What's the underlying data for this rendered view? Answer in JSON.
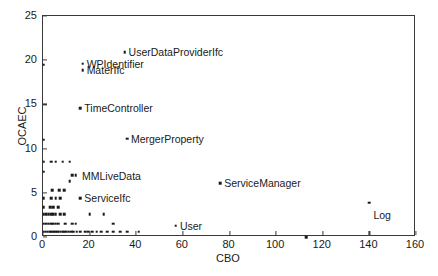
{
  "chart_data": {
    "type": "scatter",
    "title": "",
    "xlabel": "CBO",
    "ylabel": "OCAEC",
    "xlim": [
      0,
      160
    ],
    "ylim": [
      0,
      25
    ],
    "xticks": [
      0,
      20,
      40,
      60,
      80,
      100,
      120,
      140,
      160
    ],
    "yticks": [
      0,
      5,
      10,
      15,
      20,
      25
    ],
    "grid": false,
    "legend": null,
    "marker": "square-dot",
    "marker_color": "#1a1a1a",
    "annotations": [
      {
        "label": "UserDataProviderIfc",
        "x": 35,
        "y": 20.9,
        "anchor": "right"
      },
      {
        "label": "WPIdentifier",
        "x": 17,
        "y": 19.6,
        "anchor": "right"
      },
      {
        "label": "MaterIfc",
        "x": 17,
        "y": 18.9,
        "anchor": "right"
      },
      {
        "label": "TimeController",
        "x": 16,
        "y": 14.6,
        "anchor": "right"
      },
      {
        "label": "MergerProperty",
        "x": 36,
        "y": 11.1,
        "anchor": "right"
      },
      {
        "label": "MMLiveData",
        "x": 15,
        "y": 6.9,
        "anchor": "right"
      },
      {
        "label": "ServiceIfc",
        "x": 16,
        "y": 4.4,
        "anchor": "right"
      },
      {
        "label": "ServiceManager",
        "x": 76,
        "y": 6.1,
        "anchor": "right"
      },
      {
        "label": "User",
        "x": 57,
        "y": 1.3,
        "anchor": "right"
      },
      {
        "label": "Log",
        "x": 140,
        "y": 3.9,
        "anchor": "below-right"
      }
    ],
    "points": [
      {
        "x": 35,
        "y": 20.9
      },
      {
        "x": 17,
        "y": 19.6
      },
      {
        "x": 17,
        "y": 18.9
      },
      {
        "x": 0.3,
        "y": 19.5
      },
      {
        "x": 16,
        "y": 14.6
      },
      {
        "x": 36,
        "y": 11.1
      },
      {
        "x": 0.3,
        "y": 11.0
      },
      {
        "x": 0.3,
        "y": 8.5
      },
      {
        "x": 3.5,
        "y": 8.5
      },
      {
        "x": 5.5,
        "y": 8.5
      },
      {
        "x": 8.5,
        "y": 8.5
      },
      {
        "x": 11.5,
        "y": 8.5
      },
      {
        "x": 0.3,
        "y": 7.4
      },
      {
        "x": 12.5,
        "y": 7.0
      },
      {
        "x": 14.0,
        "y": 7.0
      },
      {
        "x": 11.5,
        "y": 6.3
      },
      {
        "x": 76,
        "y": 6.1
      },
      {
        "x": 4.0,
        "y": 5.3
      },
      {
        "x": 7.0,
        "y": 5.3
      },
      {
        "x": 9.0,
        "y": 5.3
      },
      {
        "x": 0.3,
        "y": 4.4
      },
      {
        "x": 3.5,
        "y": 4.4
      },
      {
        "x": 5.5,
        "y": 4.4
      },
      {
        "x": 7.5,
        "y": 4.4
      },
      {
        "x": 16,
        "y": 4.4
      },
      {
        "x": 140,
        "y": 3.9
      },
      {
        "x": 0.3,
        "y": 3.4
      },
      {
        "x": 3.0,
        "y": 3.4
      },
      {
        "x": 4.5,
        "y": 3.4
      },
      {
        "x": 6.5,
        "y": 3.4
      },
      {
        "x": 0.3,
        "y": 2.6
      },
      {
        "x": 1.5,
        "y": 2.6
      },
      {
        "x": 2.5,
        "y": 2.6
      },
      {
        "x": 3.5,
        "y": 2.6
      },
      {
        "x": 4.5,
        "y": 2.6
      },
      {
        "x": 5.5,
        "y": 2.6
      },
      {
        "x": 7.5,
        "y": 2.6
      },
      {
        "x": 9.0,
        "y": 2.6
      },
      {
        "x": 20,
        "y": 2.6
      },
      {
        "x": 26,
        "y": 2.6
      },
      {
        "x": 0.3,
        "y": 1.5
      },
      {
        "x": 1.5,
        "y": 1.5
      },
      {
        "x": 2.5,
        "y": 1.5
      },
      {
        "x": 3.5,
        "y": 1.5
      },
      {
        "x": 4.5,
        "y": 1.5
      },
      {
        "x": 5.5,
        "y": 1.5
      },
      {
        "x": 6.5,
        "y": 1.5
      },
      {
        "x": 9.5,
        "y": 1.5
      },
      {
        "x": 12.5,
        "y": 1.5
      },
      {
        "x": 14.0,
        "y": 1.5
      },
      {
        "x": 30,
        "y": 1.5
      },
      {
        "x": 57,
        "y": 1.3
      },
      {
        "x": 0.3,
        "y": 0.6
      },
      {
        "x": 1.2,
        "y": 0.6
      },
      {
        "x": 2.0,
        "y": 0.6
      },
      {
        "x": 2.8,
        "y": 0.6
      },
      {
        "x": 3.6,
        "y": 0.6
      },
      {
        "x": 4.4,
        "y": 0.6
      },
      {
        "x": 5.2,
        "y": 0.6
      },
      {
        "x": 6.0,
        "y": 0.6
      },
      {
        "x": 6.8,
        "y": 0.6
      },
      {
        "x": 7.6,
        "y": 0.6
      },
      {
        "x": 8.4,
        "y": 0.6
      },
      {
        "x": 9.2,
        "y": 0.6
      },
      {
        "x": 10.0,
        "y": 0.6
      },
      {
        "x": 11.0,
        "y": 0.6
      },
      {
        "x": 12.0,
        "y": 0.6
      },
      {
        "x": 13.0,
        "y": 0.6
      },
      {
        "x": 14.5,
        "y": 0.6
      },
      {
        "x": 16.0,
        "y": 0.6
      },
      {
        "x": 18.0,
        "y": 0.6
      },
      {
        "x": 19.5,
        "y": 0.6
      },
      {
        "x": 21.0,
        "y": 0.6
      },
      {
        "x": 23.0,
        "y": 0.6
      },
      {
        "x": 25.0,
        "y": 0.6
      },
      {
        "x": 27.5,
        "y": 0.6
      },
      {
        "x": 30.0,
        "y": 0.6
      },
      {
        "x": 33.0,
        "y": 0.6
      },
      {
        "x": 36.0,
        "y": 0.6
      },
      {
        "x": 41.0,
        "y": 0.6
      },
      {
        "x": 113.0,
        "y": 0.0
      }
    ]
  },
  "axes": {
    "x_tick_labels": [
      "0",
      "20",
      "40",
      "60",
      "80",
      "100",
      "120",
      "140",
      "160"
    ],
    "y_tick_labels": [
      "0",
      "5",
      "10",
      "15",
      "20",
      "25"
    ],
    "x_axis_title": "CBO",
    "y_axis_title": "OCAEC"
  }
}
